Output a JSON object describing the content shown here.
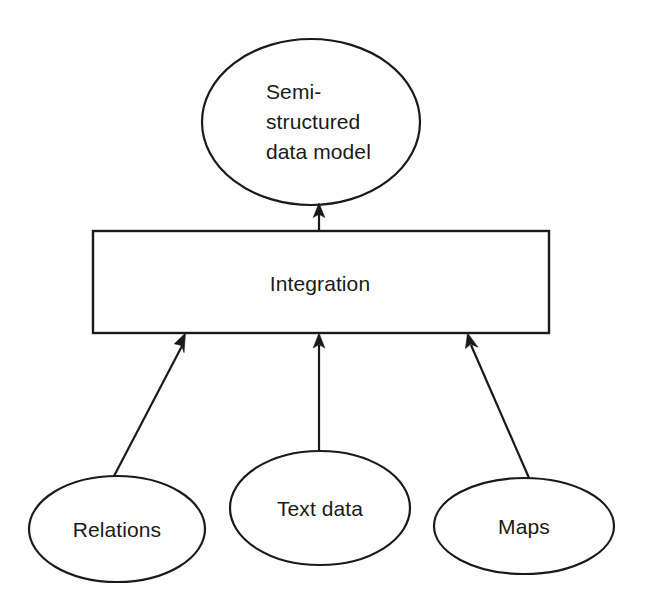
{
  "diagram": {
    "background_color": "#ffffff",
    "stroke_color": "#1a1a1a",
    "text_color": "#1a1a1a",
    "nodes": {
      "target_model": {
        "shape": "ellipse",
        "label_lines": [
          "Semi-",
          "structured",
          "data model"
        ],
        "line1": "Semi-",
        "line2": "structured",
        "line3": "data model"
      },
      "integration": {
        "shape": "rectangle",
        "label": "Integration"
      },
      "source_relations": {
        "shape": "ellipse",
        "label": "Relations"
      },
      "source_text_data": {
        "shape": "ellipse",
        "label": "Text data"
      },
      "source_maps": {
        "shape": "ellipse",
        "label": "Maps"
      }
    },
    "edges": [
      {
        "from": "Relations",
        "to": "Integration",
        "style": "arrow"
      },
      {
        "from": "Text data",
        "to": "Integration",
        "style": "arrow"
      },
      {
        "from": "Maps",
        "to": "Integration",
        "style": "arrow"
      },
      {
        "from": "Integration",
        "to": "Semi-structured data model",
        "style": "arrow"
      }
    ]
  }
}
